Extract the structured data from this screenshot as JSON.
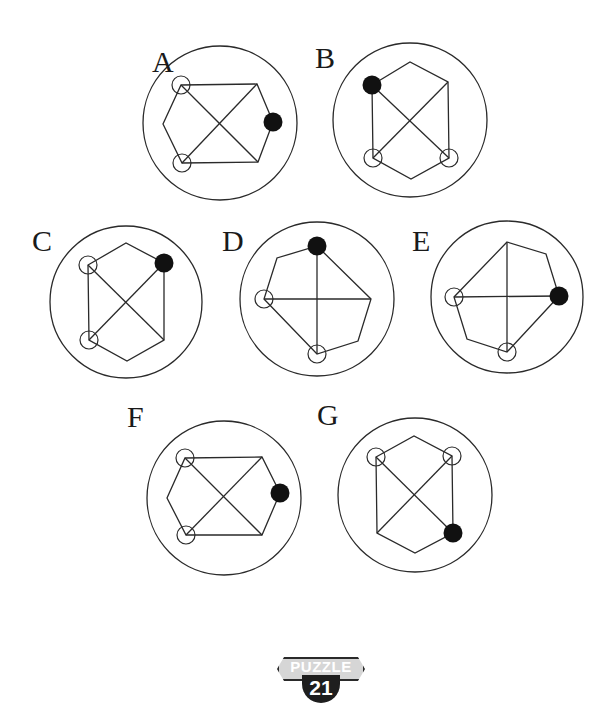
{
  "puzzle": {
    "label": "PUZZLE",
    "number": "21"
  },
  "options": [
    {
      "letter": "A",
      "letter_pos": [
        152,
        47
      ],
      "center": [
        220,
        123
      ],
      "radius": 77,
      "vertices": [
        [
          181,
          85
        ],
        [
          257,
          84
        ],
        [
          273,
          122
        ],
        [
          258,
          162
        ],
        [
          182,
          163
        ],
        [
          163,
          124
        ]
      ],
      "diagonals": [
        [
          [
            181,
            85
          ],
          [
            258,
            162
          ]
        ],
        [
          [
            257,
            84
          ],
          [
            182,
            163
          ]
        ]
      ],
      "open_nodes": [
        [
          181,
          85
        ],
        [
          182,
          163
        ]
      ],
      "filled_node": [
        273,
        122
      ]
    },
    {
      "letter": "B",
      "letter_pos": [
        315,
        43
      ],
      "center": [
        410,
        120
      ],
      "radius": 77,
      "vertices": [
        [
          372,
          85
        ],
        [
          410,
          62
        ],
        [
          448,
          82
        ],
        [
          449,
          158
        ],
        [
          411,
          179
        ],
        [
          373,
          158
        ]
      ],
      "diagonals": [
        [
          [
            372,
            85
          ],
          [
            449,
            158
          ]
        ],
        [
          [
            448,
            82
          ],
          [
            373,
            158
          ]
        ]
      ],
      "open_nodes": [
        [
          373,
          158
        ],
        [
          449,
          158
        ]
      ],
      "filled_node": [
        372,
        85
      ]
    },
    {
      "letter": "C",
      "letter_pos": [
        32,
        226
      ],
      "center": [
        126,
        302
      ],
      "radius": 76,
      "vertices": [
        [
          88,
          265
        ],
        [
          126,
          243
        ],
        [
          164,
          263
        ],
        [
          164,
          340
        ],
        [
          127,
          361
        ],
        [
          89,
          340
        ]
      ],
      "diagonals": [
        [
          [
            88,
            265
          ],
          [
            164,
            340
          ]
        ],
        [
          [
            164,
            263
          ],
          [
            89,
            340
          ]
        ]
      ],
      "open_nodes": [
        [
          88,
          265
        ],
        [
          89,
          340
        ]
      ],
      "filled_node": [
        164,
        263
      ]
    },
    {
      "letter": "D",
      "letter_pos": [
        222,
        226
      ],
      "center": [
        317,
        299
      ],
      "radius": 77,
      "vertices": [
        [
          317,
          246
        ],
        [
          371,
          299
        ],
        [
          358,
          341
        ],
        [
          317,
          354
        ],
        [
          264,
          299
        ],
        [
          277,
          258
        ]
      ],
      "diagonals": [
        [
          [
            317,
            246
          ],
          [
            317,
            354
          ]
        ],
        [
          [
            264,
            299
          ],
          [
            371,
            299
          ]
        ]
      ],
      "open_nodes": [
        [
          264,
          299
        ],
        [
          317,
          354
        ]
      ],
      "filled_node": [
        317,
        246
      ]
    },
    {
      "letter": "E",
      "letter_pos": [
        412,
        226
      ],
      "center": [
        507,
        297
      ],
      "radius": 76,
      "vertices": [
        [
          507,
          242
        ],
        [
          546,
          254
        ],
        [
          559,
          296
        ],
        [
          507,
          352
        ],
        [
          467,
          339
        ],
        [
          454,
          297
        ]
      ],
      "diagonals": [
        [
          [
            507,
            242
          ],
          [
            507,
            352
          ]
        ],
        [
          [
            454,
            297
          ],
          [
            559,
            296
          ]
        ]
      ],
      "open_nodes": [
        [
          454,
          297
        ],
        [
          507,
          352
        ]
      ],
      "filled_node": [
        559,
        296
      ]
    },
    {
      "letter": "F",
      "letter_pos": [
        127,
        402
      ],
      "center": [
        224,
        498
      ],
      "radius": 77,
      "vertices": [
        [
          185,
          458
        ],
        [
          262,
          457
        ],
        [
          280,
          493
        ],
        [
          262,
          535
        ],
        [
          186,
          535
        ],
        [
          167,
          498
        ]
      ],
      "diagonals": [
        [
          [
            185,
            458
          ],
          [
            262,
            535
          ]
        ],
        [
          [
            262,
            457
          ],
          [
            186,
            535
          ]
        ]
      ],
      "open_nodes": [
        [
          185,
          458
        ],
        [
          186,
          535
        ]
      ],
      "filled_node": [
        280,
        493
      ]
    },
    {
      "letter": "G",
      "letter_pos": [
        317,
        400
      ],
      "center": [
        415,
        495
      ],
      "radius": 77,
      "vertices": [
        [
          376,
          457
        ],
        [
          414,
          436
        ],
        [
          452,
          456
        ],
        [
          453,
          533
        ],
        [
          415,
          553
        ],
        [
          377,
          533
        ]
      ],
      "diagonals": [
        [
          [
            376,
            457
          ],
          [
            453,
            533
          ]
        ],
        [
          [
            452,
            456
          ],
          [
            377,
            533
          ]
        ]
      ],
      "open_nodes": [
        [
          376,
          457
        ],
        [
          452,
          456
        ]
      ],
      "filled_node": [
        453,
        533
      ]
    }
  ],
  "colors": {
    "stroke": "#2a2a2a",
    "filled_node": "#111111",
    "background": "#ffffff"
  }
}
